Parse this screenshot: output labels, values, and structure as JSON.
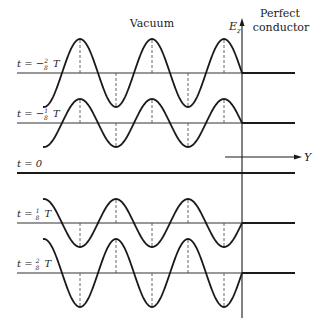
{
  "figure": {
    "region_labels": {
      "vacuum": "Vacuum",
      "conductor_line1": "Perfect",
      "conductor_line2": "conductor"
    },
    "axes": {
      "field_label": "E",
      "field_subscript": "z",
      "position_label": "Y"
    },
    "rows": [
      {
        "label_prefix": "t = −",
        "num": "2",
        "den": "8",
        "suffix": "T",
        "phase": "-2/8",
        "amplitude": 34
      },
      {
        "label_prefix": "t = −",
        "num": "1",
        "den": "8",
        "suffix": "T",
        "phase": "-1/8",
        "amplitude": 24
      },
      {
        "label_prefix": "t = 0",
        "num": "",
        "den": "",
        "suffix": "",
        "phase": "0",
        "amplitude": 0
      },
      {
        "label_prefix": "t = ",
        "num": "1",
        "den": "8",
        "suffix": "T",
        "phase": "1/8",
        "amplitude": 24
      },
      {
        "label_prefix": "t = ",
        "num": "2",
        "den": "8",
        "suffix": "T",
        "phase": "2/8",
        "amplitude": 34
      }
    ],
    "colors": {
      "line": "#1a1a1a",
      "axis": "#333333",
      "dash": "#555555"
    }
  }
}
